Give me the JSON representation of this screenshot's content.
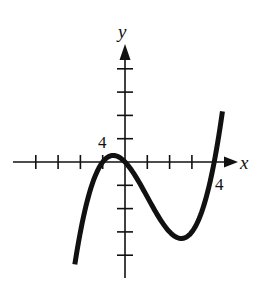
{
  "chart_data": {
    "type": "line",
    "title": "",
    "xlabel": "x",
    "ylabel": "y",
    "x_tick_label": "4",
    "y_tick_label": "4",
    "x_tick_step": 1,
    "y_tick_step": 4,
    "xlim": [
      -5,
      5
    ],
    "ylim": [
      -20,
      20
    ],
    "grid": false,
    "legend": null,
    "series": [
      {
        "name": "f(x)",
        "description": "cubic with zeros at x = -1, 0, 4",
        "x": [
          -2.25,
          -2,
          -1.5,
          -1,
          -0.53,
          0,
          0.5,
          1,
          1.5,
          2,
          2.53,
          3,
          3.5,
          4,
          4.37
        ],
        "values": [
          -17.6,
          -12,
          -4.1,
          0,
          1.13,
          0,
          -2.6,
          -6,
          -8.6,
          -12,
          -13.1,
          -12,
          -8.8,
          0,
          8.7
        ]
      }
    ],
    "features": {
      "local_max": [
        -0.53,
        1.13
      ],
      "local_min": [
        2.53,
        -13.1
      ],
      "zeros": [
        -1,
        0,
        4
      ]
    }
  },
  "labels": {
    "x_axis": "x",
    "y_axis": "y",
    "x_tick": "4",
    "y_tick": "4"
  },
  "colors": {
    "ink": "#111111",
    "background": "#ffffff"
  }
}
